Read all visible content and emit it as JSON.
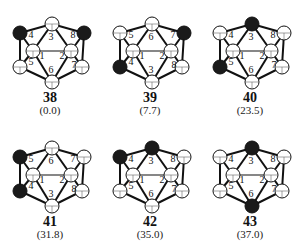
{
  "figure": {
    "structures": [
      {
        "id": "38",
        "energy": "(0.0)",
        "carbon_positions": [
          "4",
          "8"
        ],
        "labels": [
          "3",
          "4",
          "8",
          "1",
          "2",
          "5",
          "7",
          "6"
        ]
      },
      {
        "id": "39",
        "energy": "(7.7)",
        "carbon_positions": [
          "7",
          "4"
        ],
        "labels": [
          "6",
          "5",
          "7",
          "1",
          "2",
          "4",
          "8",
          "3"
        ]
      },
      {
        "id": "40",
        "energy": "(23.5)",
        "carbon_positions": [
          "3",
          "5"
        ],
        "labels": [
          "3",
          "4",
          "8",
          "1",
          "2",
          "5",
          "7",
          "6"
        ]
      },
      {
        "id": "41",
        "energy": "(31.8)",
        "carbon_positions": [
          "5",
          "4"
        ],
        "labels": [
          "6",
          "5",
          "7",
          "1",
          "2",
          "4",
          "8",
          "3"
        ]
      },
      {
        "id": "42",
        "energy": "(35.0)",
        "carbon_positions": [
          "4",
          "3"
        ],
        "labels": [
          "3",
          "4",
          "8",
          "1",
          "2",
          "5",
          "7",
          "6"
        ]
      },
      {
        "id": "43",
        "energy": "(37.0)",
        "carbon_positions": [
          "3",
          "6"
        ],
        "labels": [
          "3",
          "4",
          "8",
          "1",
          "2",
          "5",
          "7",
          "6"
        ]
      }
    ]
  }
}
